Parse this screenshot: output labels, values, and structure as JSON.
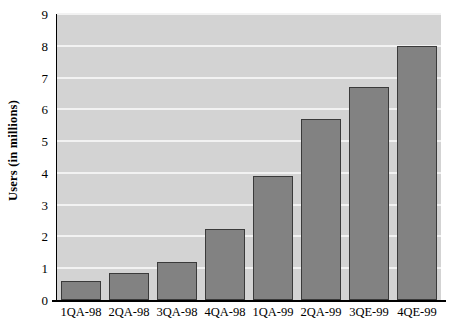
{
  "chart_data": {
    "type": "bar",
    "title": "",
    "subtitle": "",
    "xlabel": "",
    "ylabel": "Users (in millions)",
    "categories": [
      "1QA-98",
      "2QA-98",
      "3QA-98",
      "4QA-98",
      "1QA-99",
      "2QA-99",
      "3QE-99",
      "4QE-99"
    ],
    "values": [
      0.6,
      0.85,
      1.2,
      2.25,
      3.9,
      5.7,
      6.7,
      8.0
    ],
    "ylim": [
      0,
      9
    ],
    "ytick_labels": [
      "0",
      "1",
      "2",
      "3",
      "4",
      "5",
      "6",
      "7",
      "8",
      "9"
    ],
    "ytick_values": [
      0,
      1,
      2,
      3,
      4,
      5,
      6,
      7,
      8,
      9
    ],
    "grid": true,
    "grid_axis": "y",
    "legend": "none",
    "colors": {
      "bar_fill": "#828282",
      "bar_edge": "#3a3a3a",
      "plot_background": "#d3d3d3",
      "gridline": "#f2f2f2",
      "axis": "#000000",
      "text": "#000000",
      "figure_background": "#ffffff"
    }
  }
}
